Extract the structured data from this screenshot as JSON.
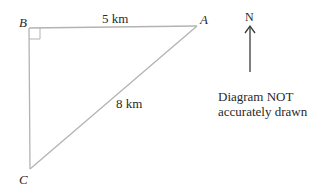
{
  "diagram": {
    "type": "right-angled triangle",
    "vertices": {
      "A": {
        "label": "A"
      },
      "B": {
        "label": "B",
        "right_angle": true
      },
      "C": {
        "label": "C"
      }
    },
    "edges": [
      {
        "from": "B",
        "to": "A",
        "label": "5 km"
      },
      {
        "from": "A",
        "to": "C",
        "label": "8 km"
      },
      {
        "from": "B",
        "to": "C",
        "label": ""
      }
    ],
    "north_arrow": {
      "label": "N"
    },
    "note": {
      "line1": "Diagram NOT",
      "line2": "accurately drawn"
    },
    "colors": {
      "line": "#b3b3b3",
      "text": "#2a2a2a"
    }
  }
}
